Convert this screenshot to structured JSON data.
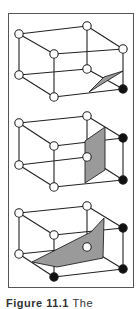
{
  "figure": {
    "caption_label": "Figure 11.1",
    "caption_text": "The"
  },
  "colors": {
    "edge": "#222222",
    "open_vertex_fill": "#ffffff",
    "filled_vertex_fill": "#111111",
    "surface_fill": "#9a9a9a",
    "frame": "#555555"
  },
  "panels": [
    {
      "name": "case-1-one-vertex",
      "offset_y": 0,
      "vertices": [
        {
          "id": "btl",
          "x": 19,
          "y": 34,
          "state": "open"
        },
        {
          "id": "btr",
          "x": 87,
          "y": 26,
          "state": "open"
        },
        {
          "id": "ftl",
          "x": 54,
          "y": 54,
          "state": "open"
        },
        {
          "id": "ftr",
          "x": 123,
          "y": 49,
          "state": "open"
        },
        {
          "id": "bbl",
          "x": 19,
          "y": 75,
          "state": "open"
        },
        {
          "id": "bbr",
          "x": 87,
          "y": 69,
          "state": "open"
        },
        {
          "id": "fbl",
          "x": 54,
          "y": 97,
          "state": "open"
        },
        {
          "id": "fbr",
          "x": 123,
          "y": 89,
          "state": "filled"
        }
      ],
      "surface": [
        [
          123,
          71
        ],
        [
          89,
          92
        ],
        [
          104,
          77
        ]
      ]
    },
    {
      "name": "case-2-two-vertices",
      "offset_y": 0,
      "vertices": [
        {
          "id": "btl",
          "x": 19,
          "y": 123,
          "state": "open"
        },
        {
          "id": "btr",
          "x": 87,
          "y": 116,
          "state": "open"
        },
        {
          "id": "ftl",
          "x": 54,
          "y": 146,
          "state": "open"
        },
        {
          "id": "ftr",
          "x": 123,
          "y": 138,
          "state": "filled"
        },
        {
          "id": "bbl",
          "x": 19,
          "y": 165,
          "state": "open"
        },
        {
          "id": "bbr",
          "x": 87,
          "y": 157,
          "state": "open"
        },
        {
          "id": "fbl",
          "x": 54,
          "y": 187,
          "state": "open"
        },
        {
          "id": "fbr",
          "x": 123,
          "y": 180,
          "state": "filled"
        }
      ],
      "surface": [
        [
          105,
          127
        ],
        [
          105,
          170
        ],
        [
          85,
          183
        ],
        [
          85,
          141
        ]
      ]
    },
    {
      "name": "case-3-three-vertices",
      "offset_y": 0,
      "vertices": [
        {
          "id": "btl",
          "x": 19,
          "y": 213,
          "state": "open"
        },
        {
          "id": "btr",
          "x": 87,
          "y": 206,
          "state": "open"
        },
        {
          "id": "ftl",
          "x": 54,
          "y": 235,
          "state": "open"
        },
        {
          "id": "ftr",
          "x": 123,
          "y": 228,
          "state": "filled"
        },
        {
          "id": "bbl",
          "x": 19,
          "y": 254,
          "state": "open"
        },
        {
          "id": "bbr",
          "x": 87,
          "y": 247,
          "state": "open"
        },
        {
          "id": "fbl",
          "x": 54,
          "y": 277,
          "state": "filled"
        },
        {
          "id": "fbr",
          "x": 123,
          "y": 269,
          "state": "filled"
        }
      ],
      "surface": [
        [
          104,
          218
        ],
        [
          103,
          258
        ],
        [
          57,
          267
        ],
        [
          32,
          262
        ],
        [
          91,
          232
        ]
      ]
    }
  ],
  "edges": [
    [
      "btl",
      "btr"
    ],
    [
      "btl",
      "ftl"
    ],
    [
      "btr",
      "ftr"
    ],
    [
      "ftl",
      "ftr"
    ],
    [
      "bbl",
      "bbr"
    ],
    [
      "bbl",
      "fbl"
    ],
    [
      "bbr",
      "fbr"
    ],
    [
      "fbl",
      "fbr"
    ],
    [
      "btl",
      "bbl"
    ],
    [
      "btr",
      "bbr"
    ],
    [
      "ftl",
      "fbl"
    ],
    [
      "ftr",
      "fbr"
    ]
  ]
}
